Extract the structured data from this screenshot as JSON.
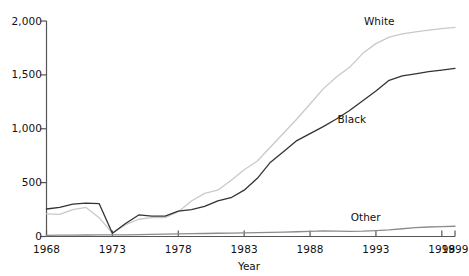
{
  "chart_data": {
    "type": "line",
    "title": "",
    "xlabel": "Year",
    "ylabel": "",
    "xlim": [
      1968,
      1999
    ],
    "ylim": [
      0,
      2000
    ],
    "grid": false,
    "legend_position": "inline-right",
    "xticks": [
      1968,
      1973,
      1978,
      1983,
      1988,
      1993,
      1998,
      1999
    ],
    "xtick_labels": [
      "1968",
      "1973",
      "1978",
      "1983",
      "1988",
      "1993",
      "1998",
      "1999"
    ],
    "yticks": [
      0,
      500,
      1000,
      1500,
      2000
    ],
    "ytick_labels": [
      "0",
      "500",
      "1,000",
      "1,500",
      "2,000"
    ],
    "x": [
      1968,
      1969,
      1970,
      1971,
      1972,
      1973,
      1974,
      1975,
      1976,
      1977,
      1978,
      1979,
      1980,
      1981,
      1982,
      1983,
      1984,
      1985,
      1986,
      1987,
      1988,
      1989,
      1990,
      1991,
      1992,
      1993,
      1994,
      1995,
      1996,
      1997,
      1998,
      1999
    ],
    "series": [
      {
        "name": "White",
        "color": "#c9c9c9",
        "label_x": 1993,
        "label_y": 1990,
        "values": [
          210,
          205,
          250,
          270,
          175,
          30,
          110,
          160,
          175,
          175,
          230,
          330,
          400,
          430,
          520,
          620,
          700,
          830,
          960,
          1090,
          1230,
          1370,
          1480,
          1570,
          1700,
          1790,
          1850,
          1880,
          1900,
          1915,
          1930,
          1940
        ]
      },
      {
        "name": "Black",
        "color": "#333333",
        "label_x": 1991,
        "label_y": 1080,
        "values": [
          255,
          270,
          300,
          310,
          305,
          30,
          120,
          200,
          190,
          190,
          235,
          250,
          280,
          330,
          360,
          430,
          540,
          690,
          790,
          890,
          955,
          1020,
          1090,
          1170,
          1260,
          1350,
          1450,
          1490,
          1510,
          1530,
          1545,
          1560
        ]
      },
      {
        "name": "Other",
        "color": "#8c8c8c",
        "label_x": 1992,
        "label_y": 170,
        "values": [
          10,
          12,
          13,
          14,
          15,
          15,
          16,
          18,
          20,
          22,
          24,
          26,
          28,
          30,
          32,
          34,
          36,
          38,
          40,
          44,
          48,
          52,
          50,
          48,
          50,
          55,
          62,
          72,
          82,
          88,
          92,
          95
        ]
      }
    ]
  },
  "axis": {
    "x_title": "Year"
  }
}
